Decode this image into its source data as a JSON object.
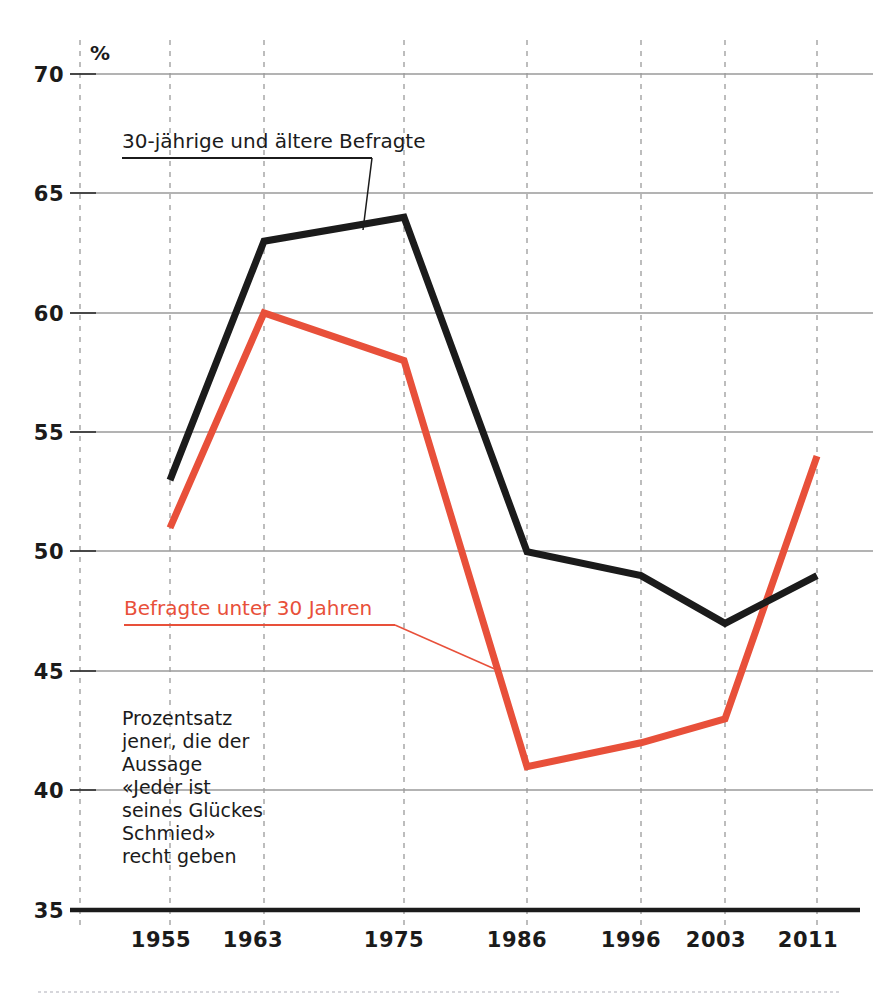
{
  "chart_data": {
    "type": "line",
    "title": "",
    "subtitle": "",
    "xlabel": "",
    "ylabel": "%",
    "unit_label": "%",
    "x": [
      "1955",
      "1963",
      "1975",
      "1986",
      "1996",
      "2003",
      "2011"
    ],
    "categories": [
      "1955",
      "1963",
      "1975",
      "1986",
      "1996",
      "2003",
      "2011"
    ],
    "ylim": [
      35,
      70
    ],
    "yticks": [
      35,
      40,
      45,
      50,
      55,
      60,
      65,
      70
    ],
    "ytick_labels": [
      "35",
      "40",
      "45",
      "50",
      "55",
      "60",
      "65",
      "70"
    ],
    "grid": "horizontal solid grey + vertical dashed grey",
    "legend_position": "inline annotations with leader lines",
    "series": [
      {
        "name": "30-jährige und ältere Befragte",
        "color": "#1b1b1b",
        "values": [
          53,
          63,
          64,
          50,
          49,
          47,
          49
        ]
      },
      {
        "name": "Befragte unter 30 Jahren",
        "color": "#e8503a",
        "values": [
          51,
          60,
          58,
          41,
          42,
          43,
          54
        ]
      }
    ],
    "annotations": [
      {
        "name": "series-label-older",
        "text": "30-jährige und ältere Befragte",
        "color": "#1b1b1b"
      },
      {
        "name": "series-label-younger",
        "text": "Befragte unter 30 Jahren",
        "color": "#e8503a"
      }
    ],
    "note_lines": [
      "Prozentsatz",
      "jener, die der",
      "Aussage",
      "«Jeder ist",
      "seines Glückes",
      "Schmied»",
      "recht geben"
    ]
  },
  "colors": {
    "series_older": "#1b1b1b",
    "series_younger": "#e8503a",
    "gridline": "#9a9a9a",
    "axis": "#1b1b1b",
    "background": "#ffffff"
  }
}
